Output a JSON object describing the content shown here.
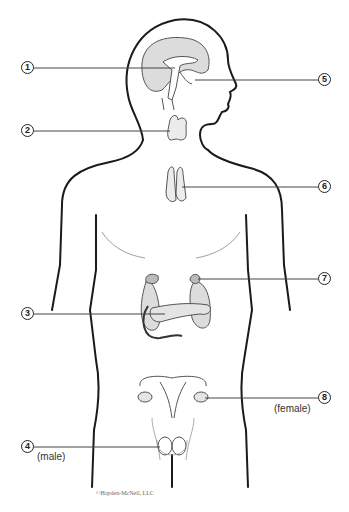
{
  "figure": {
    "type": "endocrine system diagram",
    "callouts": [
      {
        "number": "1",
        "x": 21,
        "y": 61
      },
      {
        "number": "2",
        "x": 21,
        "y": 124
      },
      {
        "number": "3",
        "x": 21,
        "y": 307
      },
      {
        "number": "4",
        "x": 21,
        "y": 440
      },
      {
        "number": "5",
        "x": 318,
        "y": 73
      },
      {
        "number": "6",
        "x": 318,
        "y": 180
      },
      {
        "number": "7",
        "x": 318,
        "y": 272
      },
      {
        "number": "8",
        "x": 318,
        "y": 391
      }
    ],
    "notes": {
      "female": "(female)",
      "male": "(male)"
    },
    "copyright": "©Hayden-McNeil, LLC",
    "colors": {
      "outline": "#1a1a1a",
      "organ_fill": "#dcdcdc",
      "leader_line": "#444444"
    }
  }
}
